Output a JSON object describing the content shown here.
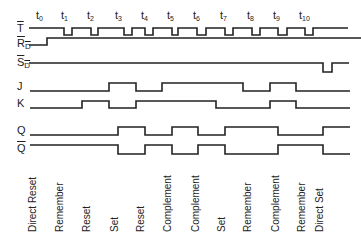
{
  "diagram": {
    "type": "timing-diagram",
    "line_color": "#222222",
    "clock_labels": [
      {
        "base": "t",
        "sub": "0",
        "x": 36
      },
      {
        "base": "t",
        "sub": "1",
        "x": 61
      },
      {
        "base": "t",
        "sub": "2",
        "x": 87
      },
      {
        "base": "t",
        "sub": "3",
        "x": 115
      },
      {
        "base": "t",
        "sub": "4",
        "x": 141
      },
      {
        "base": "t",
        "sub": "5",
        "x": 167
      },
      {
        "base": "t",
        "sub": "6",
        "x": 193
      },
      {
        "base": "t",
        "sub": "7",
        "x": 220
      },
      {
        "base": "t",
        "sub": "8",
        "x": 247
      },
      {
        "base": "t",
        "sub": "9",
        "x": 273
      },
      {
        "base": "t",
        "sub": "10",
        "x": 299
      }
    ],
    "signals": [
      {
        "name": "T",
        "overline": true,
        "sub": "",
        "label_y": 23,
        "high_y": 28,
        "low_y": 35,
        "points": [
          [
            29,
            1
          ],
          [
            64,
            0
          ],
          [
            72,
            1
          ],
          [
            91,
            0
          ],
          [
            98,
            1
          ],
          [
            124,
            0
          ],
          [
            132,
            1
          ],
          [
            145,
            0
          ],
          [
            153,
            1
          ],
          [
            172,
            0
          ],
          [
            178,
            1
          ],
          [
            197,
            0
          ],
          [
            206,
            1
          ],
          [
            225,
            0
          ],
          [
            233,
            1
          ],
          [
            252,
            0
          ],
          [
            260,
            1
          ],
          [
            278,
            0
          ],
          [
            287,
            1
          ],
          [
            305,
            0
          ],
          [
            313,
            1
          ],
          [
            348,
            1
          ]
        ]
      },
      {
        "name": "R",
        "overline": true,
        "sub": "D",
        "label_y": 38,
        "high_y": 38,
        "low_y": 45,
        "points": [
          [
            29,
            0
          ],
          [
            47,
            1
          ],
          [
            361,
            1
          ]
        ]
      },
      {
        "name": "S",
        "overline": true,
        "sub": "D",
        "label_y": 57,
        "high_y": 63,
        "low_y": 72,
        "points": [
          [
            29,
            1
          ],
          [
            323,
            0
          ],
          [
            332,
            1
          ],
          [
            349,
            1
          ]
        ]
      },
      {
        "name": "J",
        "overline": false,
        "sub": "",
        "label_y": 81,
        "high_y": 83,
        "low_y": 91,
        "points": [
          [
            30,
            0
          ],
          [
            109,
            1
          ],
          [
            136,
            0
          ],
          [
            162,
            1
          ],
          [
            243,
            0
          ],
          [
            270,
            1
          ],
          [
            296,
            0
          ],
          [
            350,
            0
          ]
        ]
      },
      {
        "name": "K",
        "overline": false,
        "sub": "",
        "label_y": 98,
        "high_y": 101,
        "low_y": 108,
        "points": [
          [
            30,
            0
          ],
          [
            82,
            1
          ],
          [
            109,
            0
          ],
          [
            136,
            1
          ],
          [
            216,
            0
          ],
          [
            270,
            1
          ],
          [
            296,
            0
          ],
          [
            350,
            0
          ]
        ]
      },
      {
        "name": "Q",
        "overline": false,
        "sub": "",
        "label_y": 125,
        "high_y": 127,
        "low_y": 135,
        "points": [
          [
            30,
            0
          ],
          [
            118,
            1
          ],
          [
            145,
            0
          ],
          [
            172,
            1
          ],
          [
            198,
            0
          ],
          [
            225,
            1
          ],
          [
            278,
            0
          ],
          [
            323,
            1
          ],
          [
            350,
            1
          ]
        ]
      },
      {
        "name": "Q",
        "overline": true,
        "sub": "",
        "label_y": 143,
        "high_y": 145,
        "low_y": 154,
        "points": [
          [
            30,
            1
          ],
          [
            118,
            0
          ],
          [
            145,
            1
          ],
          [
            172,
            0
          ],
          [
            198,
            1
          ],
          [
            225,
            0
          ],
          [
            278,
            1
          ],
          [
            323,
            0
          ],
          [
            350,
            0
          ]
        ]
      }
    ],
    "operations": [
      {
        "label": "Direct Reset",
        "x": 27
      },
      {
        "label": "Remember",
        "x": 54
      },
      {
        "label": "Reset",
        "x": 81
      },
      {
        "label": "Set",
        "x": 109
      },
      {
        "label": "Reset",
        "x": 135
      },
      {
        "label": "Complement",
        "x": 162
      },
      {
        "label": "Complement",
        "x": 190
      },
      {
        "label": "Set",
        "x": 216
      },
      {
        "label": "Remember",
        "x": 242
      },
      {
        "label": "Complement",
        "x": 270
      },
      {
        "label": "Remember",
        "x": 296
      },
      {
        "label": "Direct Set",
        "x": 314
      }
    ]
  }
}
